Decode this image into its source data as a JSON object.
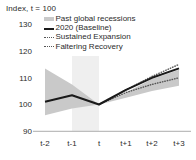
{
  "chart_data": {
    "type": "line",
    "title": "Index, t = 100",
    "xlabel": "",
    "ylabel": "",
    "ylim": [
      90,
      130
    ],
    "yticks": [
      90,
      100,
      110,
      120,
      130
    ],
    "categories": [
      "t-2",
      "t-1",
      "t",
      "t+1",
      "t+2",
      "t+3"
    ],
    "grid": false,
    "legend_position": "top-right",
    "series": [
      {
        "name": "Past global recessions",
        "type": "band",
        "color": "#c9c9c9",
        "upper": [
          113.5,
          107.5,
          100.0,
          104.5,
          109.5,
          113.0
        ],
        "lower": [
          96.0,
          98.5,
          100.0,
          102.5,
          105.0,
          107.0
        ]
      },
      {
        "name": "2020 (Baseline)",
        "type": "line",
        "color": "#1a1a1a",
        "values": [
          101.0,
          103.5,
          100.0,
          105.5,
          110.0,
          113.5
        ]
      },
      {
        "name": "Sustained Expansion",
        "type": "dotted",
        "color": "#555555",
        "values": [
          null,
          null,
          100.0,
          105.5,
          110.5,
          115.0
        ]
      },
      {
        "name": "Faltering Recovery",
        "type": "dotted",
        "color": "#555555",
        "values": [
          null,
          null,
          100.0,
          104.5,
          107.5,
          110.0
        ]
      }
    ]
  },
  "axis": {
    "title": "Index, t = 100",
    "ytick_labels": [
      "130",
      "120",
      "110",
      "100",
      "90"
    ],
    "xtick_labels": [
      "t-2",
      "t-1",
      "t",
      "t+1",
      "t+2",
      "t+3"
    ]
  },
  "legend": {
    "items": [
      {
        "label": "Past global recessions",
        "marker": "band-swatch"
      },
      {
        "label": "2020 (Baseline)",
        "marker": "solid-line"
      },
      {
        "label": "Sustained Expansion",
        "marker": "dotted-line"
      },
      {
        "label": "Faltering Recovery",
        "marker": "dotted-line"
      }
    ]
  },
  "colors": {
    "band": "#c9c9c9",
    "recession_shade": "#efefef",
    "baseline": "#1a1a1a",
    "dotted": "#555555",
    "axis": "#bdbdbd",
    "text": "#2b2b2b"
  }
}
